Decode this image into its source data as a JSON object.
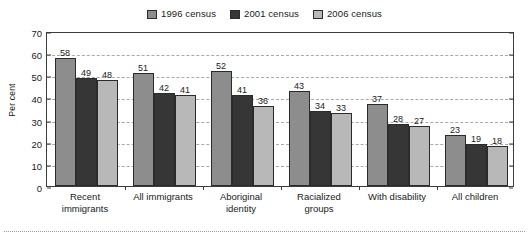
{
  "chart_data": {
    "type": "bar",
    "title": "",
    "subtitle": "",
    "xlabel": "",
    "ylabel": "Per cent",
    "ylim": [
      0,
      70
    ],
    "yticks": [
      0,
      10,
      20,
      30,
      40,
      50,
      60,
      70
    ],
    "grid": true,
    "legend_position": "top-center",
    "categories": [
      "Recent immigrants",
      "All immigrants",
      "Aboriginal identity",
      "Racialized groups",
      "With disability",
      "All children"
    ],
    "category_lines": [
      [
        "Recent",
        "immigrants"
      ],
      [
        "All immigrants"
      ],
      [
        "Aboriginal",
        "identity"
      ],
      [
        "Racialized",
        "groups"
      ],
      [
        "With disability"
      ],
      [
        "All children"
      ]
    ],
    "series": [
      {
        "name": "1996 census",
        "color": "#8d8d8d",
        "values": [
          58,
          51,
          52,
          43,
          37,
          23
        ]
      },
      {
        "name": "2001 census",
        "color": "#363636",
        "values": [
          49,
          42,
          41,
          34,
          28,
          19
        ]
      },
      {
        "name": "2006 census",
        "color": "#b8b8b8",
        "values": [
          48,
          41,
          36,
          33,
          27,
          18
        ]
      }
    ]
  },
  "axis": {
    "ytick_labels": [
      "0",
      "10",
      "20",
      "30",
      "40",
      "50",
      "60",
      "70"
    ],
    "ylabel": "Per cent"
  },
  "legend": {
    "entries": [
      {
        "label": "1996 census",
        "color": "#8d8d8d"
      },
      {
        "label": "2001 census",
        "color": "#363636"
      },
      {
        "label": "2006 census",
        "color": "#b8b8b8"
      }
    ]
  }
}
